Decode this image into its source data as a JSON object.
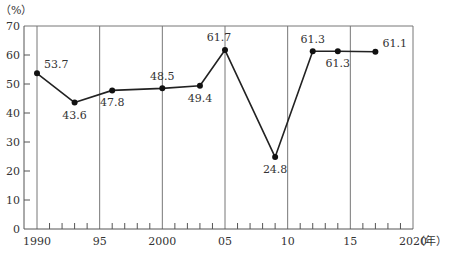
{
  "chart_data": {
    "type": "line",
    "title": "",
    "xlabel": "（年）",
    "ylabel": "（%）",
    "x": [
      1990,
      1993,
      1996,
      2000,
      2003,
      2005,
      2009,
      2012,
      2014,
      2017
    ],
    "series": [
      {
        "name": "",
        "values": [
          53.7,
          43.6,
          47.8,
          48.5,
          49.4,
          61.7,
          24.8,
          61.3,
          61.3,
          61.1
        ]
      }
    ],
    "data_labels": [
      "53.7",
      "43.6",
      "47.8",
      "48.5",
      "49.4",
      "61.7",
      "24.8",
      "61.3",
      "61.3",
      "61.1"
    ],
    "label_position": [
      "right-above",
      "below",
      "below",
      "above",
      "below",
      "above-left",
      "below",
      "above",
      "below",
      "right-above"
    ],
    "xlim": [
      1990,
      2020
    ],
    "ylim": [
      0,
      70
    ],
    "x_ticks": [
      1990,
      1995,
      2000,
      2005,
      2010,
      2015,
      2020
    ],
    "x_tick_labels": [
      "1990",
      "95",
      "2000",
      "05",
      "10",
      "15",
      "2020"
    ],
    "y_ticks": [
      0,
      10,
      20,
      30,
      40,
      50,
      60,
      70
    ],
    "y_tick_labels": [
      "0",
      "10",
      "20",
      "30",
      "40",
      "50",
      "60",
      "70"
    ],
    "x_minor_tick_step": 1,
    "grid": "vertical-major",
    "legend": "none",
    "colors": {
      "line": "#222222",
      "marker": "#111111",
      "axis": "#555555",
      "grid": "#777777",
      "text": "#333333"
    }
  }
}
